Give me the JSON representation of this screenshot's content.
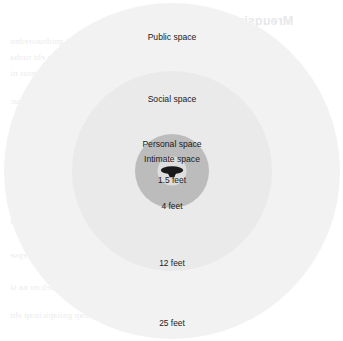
{
  "diagram": {
    "type": "concentric-zones",
    "center": {
      "x": 172,
      "y": 172
    },
    "background_color": "#ffffff",
    "text_color": "#1b1b1b",
    "figure": {
      "name": "person-silhouette",
      "color": "#1a1a1a",
      "view": "top-down"
    },
    "zones": [
      {
        "id": "public",
        "label": "Public space",
        "distance": "25 feet",
        "radius_px": 168,
        "color": "#f2f2f2"
      },
      {
        "id": "social",
        "label": "Social space",
        "distance": "12 feet",
        "radius_px": 100,
        "color": "#eaeaea"
      },
      {
        "id": "personal",
        "label": "Personal space",
        "distance": "4 feet",
        "radius_px": 37,
        "color": "#bcbcbc"
      },
      {
        "id": "intimate",
        "label": "Intimate space",
        "distance": "1.5 feet",
        "radius_px": 14.5,
        "color": "#dedede"
      }
    ]
  },
  "background_artifacts": {
    "description": "faint mirrored bleed-through text from reverse of scanned page",
    "color": "#ebeced",
    "heading": "Mreuqsiro nsfeevirg",
    "lines": [
      "noitacinummoc labrevnon fo erutan eht gnidnatsrednu",
      "ecaps lanosrep dna ecnatsid fo noitpecrep eht tuoba",
      "serutluc tnereffid ssorca yrav hcihw ,snoiger emos ni",
      "tcatnoc eye dna erutsop ,serutseg sa hcus ,seuc",
      "nosrep a fo troflmoc fo level eht etacidni yam",
      "noitasrevnoc a gnirud decaf era yeht nehw",
      "laicos ni tnatropmi yllaicepse si sihT",
      "tnemnorivne lanoisseforp ro sgnittes",
      "ereht erehw snoitautis ni yllaicepse",
      "neewteb pihsnoitaler raelcnu na si",
      "seitrap gnitapicitrap eht"
    ]
  }
}
